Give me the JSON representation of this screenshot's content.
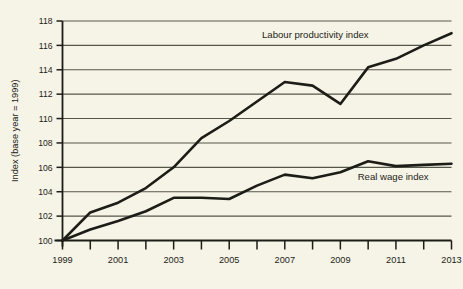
{
  "chart_data": {
    "type": "line",
    "title": "",
    "xlabel": "",
    "ylabel": "Index (base year = 1999)",
    "xlim": [
      1999,
      2013
    ],
    "ylim": [
      100,
      118
    ],
    "ytick_step": 2,
    "xtick_step": 1,
    "xtick_label_step": 2,
    "grid": true,
    "legend_position": "inline-annotation",
    "x": [
      1999,
      2000,
      2001,
      2002,
      2003,
      2004,
      2005,
      2006,
      2007,
      2008,
      2009,
      2010,
      2011,
      2012,
      2013
    ],
    "xticklabels": [
      "1999",
      "",
      "2001",
      "",
      "2003",
      "",
      "2005",
      "",
      "2007",
      "",
      "2009",
      "",
      "2011",
      "",
      "2013"
    ],
    "yticklabels": [
      "100",
      "102",
      "104",
      "106",
      "108",
      "110",
      "112",
      "114",
      "116",
      "118"
    ],
    "yticks": [
      100,
      102,
      104,
      106,
      108,
      110,
      112,
      114,
      116,
      118
    ],
    "series": [
      {
        "name": "Labour productivity index",
        "label": "Labour productivity index",
        "color": "#1d1d18",
        "values": [
          100.0,
          102.3,
          103.1,
          104.3,
          106.0,
          108.4,
          109.8,
          111.4,
          113.0,
          112.7,
          111.2,
          114.2,
          114.9,
          116.0,
          117.0
        ]
      },
      {
        "name": "Real wage index",
        "label": "Real wage index",
        "color": "#1d1d18",
        "values": [
          100.0,
          100.9,
          101.6,
          102.4,
          103.5,
          103.5,
          103.4,
          104.5,
          105.4,
          105.1,
          105.6,
          106.5,
          106.1,
          106.2,
          106.3
        ]
      }
    ],
    "annotations": [
      {
        "text": "Labour productivity index",
        "x": 2008.1,
        "y": 116.6,
        "anchor": "middle"
      },
      {
        "text": "Real wage index",
        "x": 2010.9,
        "y": 105.0,
        "anchor": "middle"
      }
    ],
    "colors": {
      "background": "#f6f4e7",
      "line": "#1d1d18",
      "grid": "#55564a",
      "axis": "#1d1d18",
      "text": "#1d1d18"
    }
  }
}
